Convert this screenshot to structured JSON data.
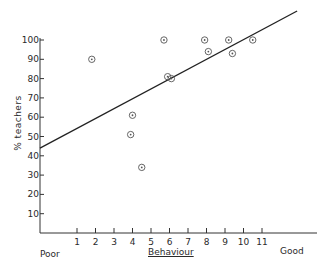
{
  "chart_data": {
    "type": "scatter",
    "title": "",
    "xlabel": "Behaviour",
    "ylabel": "% teachers",
    "x_end_labels": {
      "left": "Poor",
      "right": "Good"
    },
    "xticks": [
      1,
      2,
      3,
      4,
      5,
      6,
      7,
      8,
      9,
      10,
      11
    ],
    "yticks": [
      10,
      20,
      30,
      40,
      50,
      60,
      70,
      80,
      90,
      100
    ],
    "xlim": [
      -1,
      13.5
    ],
    "ylim": [
      0,
      100
    ],
    "grid": false,
    "legend": null,
    "points": [
      {
        "x": 1.8,
        "y": 90
      },
      {
        "x": 4.0,
        "y": 61
      },
      {
        "x": 3.9,
        "y": 51
      },
      {
        "x": 4.5,
        "y": 34
      },
      {
        "x": 5.7,
        "y": 100
      },
      {
        "x": 5.9,
        "y": 81
      },
      {
        "x": 6.1,
        "y": 80
      },
      {
        "x": 7.9,
        "y": 100
      },
      {
        "x": 8.1,
        "y": 94
      },
      {
        "x": 9.2,
        "y": 100
      },
      {
        "x": 9.4,
        "y": 93
      },
      {
        "x": 10.5,
        "y": 100
      }
    ],
    "fit_line": {
      "x0": -1,
      "y0": 44,
      "x1": 12.9,
      "y1": 115
    }
  },
  "labels": {
    "ylabel": "% teachers",
    "xlabel": "Behaviour",
    "poor": "Poor",
    "good": "Good"
  },
  "colors": {
    "ink": "#2a2a2a",
    "background": "#ffffff"
  }
}
